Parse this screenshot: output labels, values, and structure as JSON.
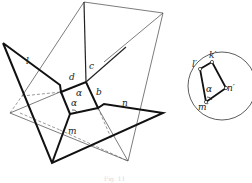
{
  "diagram": {
    "type": "geometric-projection-figure",
    "main_figure": {
      "edge_labels": {
        "l": "l",
        "c": "c",
        "d": "d",
        "b": "b",
        "n": "n",
        "m": "m"
      },
      "face_label": "α",
      "angle_label": "α"
    },
    "circle_figure": {
      "vertex_labels": {
        "l": "l′",
        "k": "k′",
        "n": "n′",
        "m": "m′"
      },
      "angle_label": "α"
    },
    "caption": "Fig. 11"
  },
  "colors": {
    "line": "#1a1a1a",
    "thin_line": "#444444",
    "background": "#ffffff"
  }
}
